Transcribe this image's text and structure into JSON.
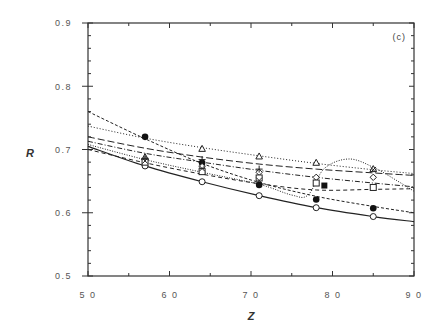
{
  "chart_data": {
    "type": "line",
    "title": "",
    "panel_label": "(c)",
    "xlabel": "Z",
    "ylabel": "R",
    "xlim": [
      50,
      90
    ],
    "ylim": [
      0.5,
      0.9
    ],
    "xticks": [
      "50",
      "60",
      "70",
      "80",
      "90"
    ],
    "yticks": [
      "0.5",
      "0.6",
      "0.7",
      "0.8",
      "0.9"
    ],
    "grid": false,
    "legend": "none",
    "points_x": [
      57,
      64,
      71,
      78,
      85
    ],
    "series": [
      {
        "name": "open circles (data)",
        "marker": "circle-open",
        "x": [
          57,
          64,
          71,
          78,
          85
        ],
        "values": [
          0.674,
          0.649,
          0.627,
          0.608,
          0.594
        ]
      },
      {
        "name": "filled circles (data)",
        "marker": "circle-filled",
        "x": [
          57,
          64,
          71,
          78,
          85
        ],
        "values": [
          0.72,
          0.679,
          0.644,
          0.621,
          0.607
        ]
      },
      {
        "name": "open triangles (data)",
        "marker": "triangle-open",
        "x": [
          57,
          64,
          71,
          78,
          85
        ],
        "values": [
          0.688,
          0.701,
          0.689,
          0.679,
          0.669
        ]
      },
      {
        "name": "open diamonds (data)",
        "marker": "diamond-open",
        "x": [
          57,
          64,
          71,
          78,
          85
        ],
        "values": [
          0.684,
          0.673,
          0.664,
          0.656,
          0.656
        ]
      },
      {
        "name": "open squares (data)",
        "marker": "square-open",
        "x": [
          57,
          64,
          71,
          78,
          85
        ],
        "values": [
          0.68,
          0.665,
          0.655,
          0.647,
          0.64
        ]
      },
      {
        "name": "plus (data)",
        "marker": "plus",
        "x": [
          57,
          64,
          71
        ],
        "values": [
          0.686,
          0.684,
          0.669
        ]
      },
      {
        "name": "cross (data)",
        "marker": "cross",
        "x": [
          57,
          64,
          71,
          85
        ],
        "values": [
          0.682,
          0.67,
          0.651,
          0.668
        ]
      },
      {
        "name": "filled square (data)",
        "marker": "square-filled",
        "x": [
          79
        ],
        "values": [
          0.643
        ]
      },
      {
        "name": "solid curve",
        "style": "solid",
        "x": [
          50,
          57,
          64,
          71,
          78,
          85,
          90
        ],
        "values": [
          0.705,
          0.674,
          0.649,
          0.627,
          0.608,
          0.594,
          0.586
        ]
      },
      {
        "name": "short-dashed curve (steep)",
        "style": "dashed-short",
        "x": [
          50,
          57,
          64,
          71,
          78,
          85,
          90
        ],
        "values": [
          0.76,
          0.717,
          0.678,
          0.648,
          0.626,
          0.61,
          0.6
        ]
      },
      {
        "name": "dotted curve",
        "style": "dotted",
        "x": [
          50,
          57,
          64,
          71,
          78,
          85,
          90
        ],
        "values": [
          0.737,
          0.718,
          0.703,
          0.69,
          0.678,
          0.668,
          0.662
        ]
      },
      {
        "name": "long-dashed curve",
        "style": "dashed-long",
        "x": [
          50,
          57,
          64,
          71,
          78,
          85,
          90
        ],
        "values": [
          0.72,
          0.702,
          0.688,
          0.677,
          0.669,
          0.663,
          0.659
        ]
      },
      {
        "name": "dash-dot curve",
        "style": "dash-dot",
        "x": [
          50,
          57,
          64,
          71,
          78,
          85,
          90
        ],
        "values": [
          0.713,
          0.694,
          0.68,
          0.667,
          0.656,
          0.647,
          0.641
        ]
      },
      {
        "name": "dashed curve (lower)",
        "style": "dashed",
        "x": [
          50,
          57,
          64,
          71,
          78,
          85,
          90
        ],
        "values": [
          0.7,
          0.679,
          0.661,
          0.646,
          0.636,
          0.637,
          0.638
        ]
      },
      {
        "name": "wavy dotted curve",
        "style": "dotted-fine",
        "x": [
          50,
          57,
          64,
          71,
          75,
          77,
          79,
          82,
          85,
          88,
          90
        ],
        "values": [
          0.708,
          0.684,
          0.664,
          0.645,
          0.628,
          0.628,
          0.67,
          0.685,
          0.672,
          0.65,
          0.634
        ]
      }
    ]
  },
  "axes": {
    "x_label": "Z",
    "y_label": "R",
    "x_ticks": [
      "5 0",
      "6 0",
      "7 0",
      "8 0",
      "9 0"
    ],
    "y_ticks": [
      "0.5",
      "0.6",
      "0.7",
      "0.8",
      "0.9"
    ],
    "panel_label": "(c)"
  }
}
